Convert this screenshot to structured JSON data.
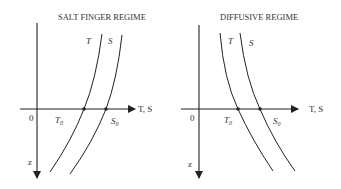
{
  "panels": [
    {
      "title": "SALT FINGER REGIME",
      "curve_labels": {
        "t": "T",
        "s": "S"
      },
      "origin_label": "0",
      "x_axis_label": "T, S",
      "z_axis_label": "z",
      "t0_label": "T",
      "t0_sub": "0",
      "s0_label": "S",
      "s0_sub": "0"
    },
    {
      "title": "DIFFUSIVE REGIME",
      "curve_labels": {
        "t": "T",
        "s": "S"
      },
      "origin_label": "0",
      "x_axis_label": "T, S",
      "z_axis_label": "z",
      "t0_label": "T",
      "t0_sub": "0",
      "s0_label": "S",
      "s0_sub": "0"
    }
  ],
  "colors": {
    "line": "#222222",
    "text": "#333333"
  }
}
